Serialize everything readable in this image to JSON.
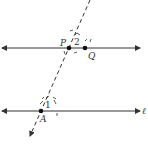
{
  "diagram": {
    "type": "geometry-construction",
    "lines": {
      "top_line": {
        "label": "",
        "points": [
          "P",
          "Q"
        ]
      },
      "bottom_line": {
        "label": "ℓ",
        "points": [
          "A"
        ]
      },
      "transversal": {
        "style": "dashed",
        "through": [
          "P",
          "A"
        ]
      }
    },
    "points": [
      {
        "name": "P",
        "label": "P"
      },
      {
        "name": "Q",
        "label": "Q"
      },
      {
        "name": "A",
        "label": "A"
      }
    ],
    "angles": [
      {
        "name": "angle-1",
        "label": "1",
        "at": "A"
      },
      {
        "name": "angle-2",
        "label": "2",
        "at": "P"
      }
    ],
    "colors": {
      "stroke": "#333333",
      "background": "#ffffff"
    }
  }
}
